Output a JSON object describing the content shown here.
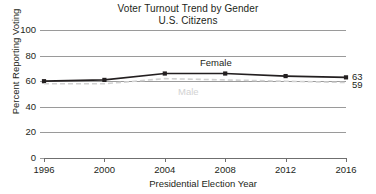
{
  "chart_data": {
    "type": "line",
    "title": "Voter Turnout Trend by Gender",
    "subtitle": "U.S. Citizens",
    "xlabel": "Presidential Election Year",
    "ylabel": "Percent Reporting Voting",
    "x": [
      1996,
      2000,
      2004,
      2008,
      2012,
      2016
    ],
    "categories": [
      "1996",
      "2000",
      "2004",
      "2008",
      "2012",
      "2016"
    ],
    "xticklabels": [
      "1996",
      "2000",
      "2004",
      "2008",
      "2012",
      "2016"
    ],
    "yticklabels": [
      "0",
      "20",
      "40",
      "60",
      "80",
      "100"
    ],
    "yticks": [
      0,
      20,
      40,
      60,
      80,
      100
    ],
    "ylim": [
      0,
      100
    ],
    "xlim": [
      1996,
      2016
    ],
    "grid": "horizontal",
    "legend": "inline-labels",
    "series": [
      {
        "name": "Female",
        "label": "Female",
        "values": [
          60,
          61,
          66,
          66,
          64,
          63
        ],
        "color": "#231f20",
        "style": "solid",
        "marker": "square",
        "end_label": "63"
      },
      {
        "name": "Male",
        "label": "Male",
        "values": [
          58,
          58,
          62,
          61,
          60,
          59
        ],
        "color": "#d2d2d2",
        "style": "dashed",
        "marker": "none",
        "end_label": "59"
      }
    ],
    "annotations": [
      {
        "text": "Female",
        "series": "Female"
      },
      {
        "text": "Male",
        "series": "Male"
      },
      {
        "text": "63",
        "series": "Female",
        "position": "end"
      },
      {
        "text": "59",
        "series": "Male",
        "position": "end"
      }
    ]
  },
  "colors": {
    "background": "#ffffff",
    "text": "#231f20",
    "gridline": "#9a9a9a",
    "axis": "#6f6f6f",
    "female_series": "#231f20",
    "male_series": "#d2d2d2"
  }
}
